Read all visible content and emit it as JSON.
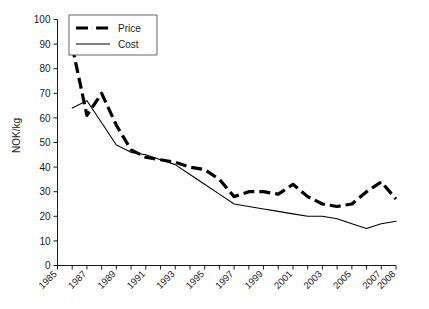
{
  "chart_data": {
    "type": "line",
    "title": "",
    "xlabel": "",
    "ylabel": "NOK/kg",
    "ylim": [
      0,
      100
    ],
    "xlim": [
      1985,
      2008
    ],
    "grid": false,
    "legend_position": "top-left",
    "y_ticks": [
      0,
      10,
      20,
      30,
      40,
      50,
      60,
      70,
      80,
      90,
      100
    ],
    "x_ticks": [
      1985,
      1986,
      1987,
      1988,
      1989,
      1990,
      1991,
      1992,
      1993,
      1994,
      1995,
      1996,
      1997,
      1998,
      1999,
      2000,
      2001,
      2002,
      2003,
      2004,
      2005,
      2006,
      2007,
      2008
    ],
    "x_tick_labels": [
      "1985",
      "",
      "1987",
      "",
      "1989",
      "",
      "1991",
      "",
      "1993",
      "",
      "1995",
      "",
      "1997",
      "",
      "1999",
      "",
      "2001",
      "",
      "2003",
      "",
      "2005",
      "",
      "2007",
      "2008"
    ],
    "x": [
      1986,
      1987,
      1988,
      1989,
      1990,
      1991,
      1992,
      1993,
      1994,
      1995,
      1996,
      1997,
      1998,
      1999,
      2000,
      2001,
      2002,
      2003,
      2004,
      2005,
      2006,
      2007,
      2008
    ],
    "series": [
      {
        "name": "Price",
        "style": "dash-dot",
        "values": [
          89,
          61,
          70,
          57,
          47,
          44,
          43,
          42,
          40,
          39,
          35,
          28,
          30,
          30,
          29,
          33,
          28,
          25,
          24,
          25,
          30,
          34,
          27
        ]
      },
      {
        "name": "Cost",
        "style": "solid",
        "values": [
          64,
          67,
          58,
          49,
          46,
          45,
          43,
          41,
          37,
          33,
          29,
          25,
          24,
          23,
          22,
          21,
          20,
          20,
          19,
          17,
          15,
          17,
          18
        ]
      }
    ],
    "legend_entries": [
      {
        "label": "Price",
        "style": "dash-dot"
      },
      {
        "label": "Cost",
        "style": "solid"
      }
    ]
  },
  "axis": {
    "y_title": "NOK/kg"
  }
}
